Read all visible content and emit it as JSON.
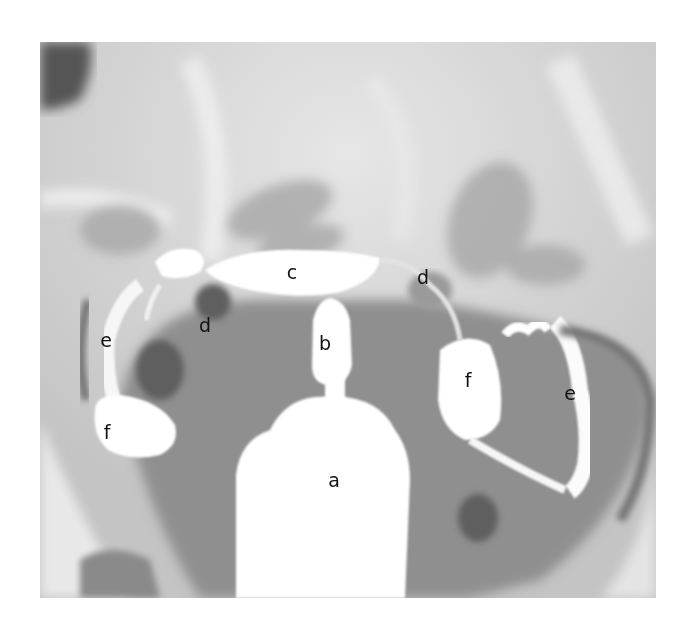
{
  "figure": {
    "type": "radiograph",
    "colors": {
      "background": "#ffffff",
      "soft_tissue": "#c9c9c9",
      "pelvis_dark": "#8a8a8a",
      "contrast": "#ffffff",
      "label_text": "#111111"
    }
  },
  "labels": [
    {
      "id": "a",
      "text": "a",
      "x": 334,
      "y": 480
    },
    {
      "id": "b",
      "text": "b",
      "x": 325,
      "y": 343
    },
    {
      "id": "c",
      "text": "c",
      "x": 292,
      "y": 272
    },
    {
      "id": "d_left",
      "text": "d",
      "x": 205,
      "y": 325
    },
    {
      "id": "d_right",
      "text": "d",
      "x": 423,
      "y": 277
    },
    {
      "id": "e_left",
      "text": "e",
      "x": 106,
      "y": 340
    },
    {
      "id": "e_right",
      "text": "e",
      "x": 570,
      "y": 393
    },
    {
      "id": "f_left",
      "text": "f",
      "x": 107,
      "y": 432
    },
    {
      "id": "f_right",
      "text": "f",
      "x": 468,
      "y": 380
    }
  ]
}
